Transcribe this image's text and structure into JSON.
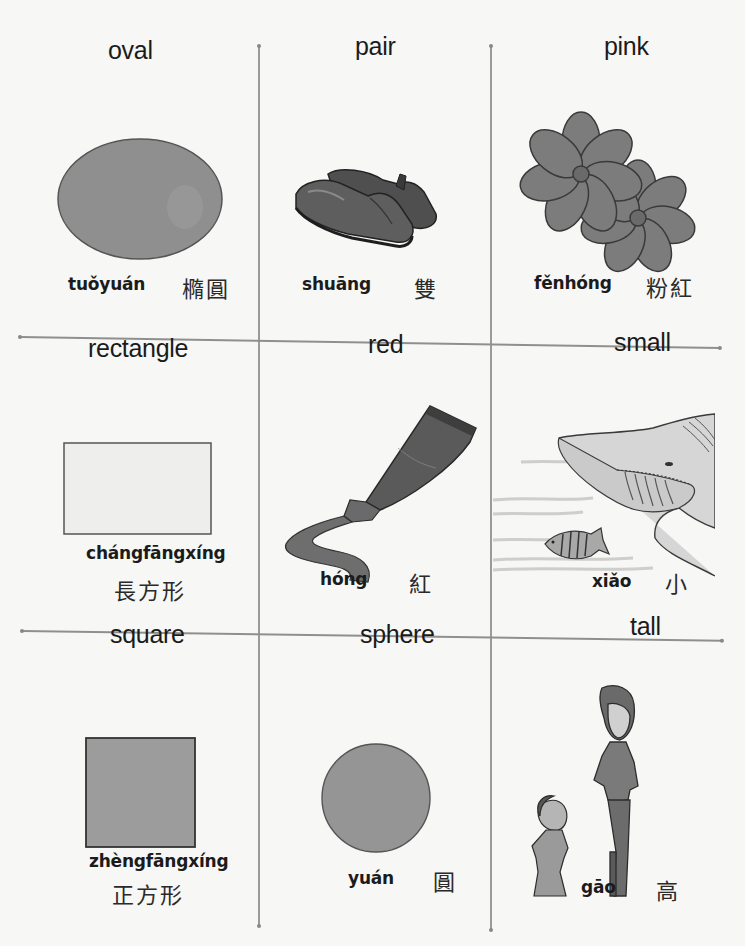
{
  "grid": {
    "rows": 3,
    "columns": 3,
    "line_color": "#9a9a9a"
  },
  "cards": [
    {
      "word": "oval",
      "pinyin": "tuǒyuán",
      "hanzi": "橢圓",
      "illustration": "gray-oval-shape"
    },
    {
      "word": "pair",
      "pinyin": "shuāng",
      "hanzi": "雙",
      "illustration": "pair-of-shoes"
    },
    {
      "word": "pink",
      "pinyin": "fěnhóng",
      "hanzi": "粉紅",
      "illustration": "two-flowers"
    },
    {
      "word": "rectangle",
      "pinyin": "chángfāngxíng",
      "hanzi": "長方形",
      "illustration": "outlined-rectangle"
    },
    {
      "word": "red",
      "pinyin": "hóng",
      "hanzi": "紅",
      "illustration": "paint-tube-squeezing"
    },
    {
      "word": "small",
      "pinyin": "xiǎo",
      "hanzi": "小",
      "illustration": "small-fish-and-shark"
    },
    {
      "word": "square",
      "pinyin": "zhèngfāngxíng",
      "hanzi": "正方形",
      "illustration": "gray-square"
    },
    {
      "word": "sphere",
      "pinyin": "yuán",
      "hanzi": "圓",
      "illustration": "gray-circle"
    },
    {
      "word": "tall",
      "pinyin": "gāo",
      "hanzi": "高",
      "illustration": "tall-man-short-woman"
    }
  ],
  "colors": {
    "shape_fill": "#8e8e8e",
    "shape_fill_light": "#e9e9e7",
    "ink": "#1b1b1b",
    "paper": "#f7f7f5"
  }
}
